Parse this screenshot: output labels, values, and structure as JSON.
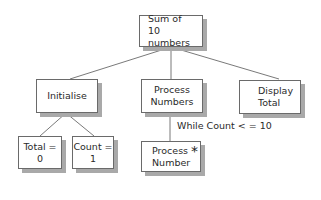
{
  "diagram": {
    "type": "structure-chart",
    "root": {
      "line1": "Sum of",
      "line2": "10 numbers"
    },
    "children": [
      {
        "id": "initialise",
        "line1": "Initialise",
        "line2": ""
      },
      {
        "id": "process-numbers",
        "line1": "Process",
        "line2": "Numbers"
      },
      {
        "id": "display-total",
        "line1": "Display",
        "line2": "Total"
      }
    ],
    "initialise_children": [
      {
        "id": "total",
        "label": "Total = 0"
      },
      {
        "id": "count",
        "label": "Count = 1"
      }
    ],
    "process_children": [
      {
        "id": "process-number",
        "line1": "Process",
        "line2": "Number",
        "marker": "*"
      }
    ],
    "loop_condition": "While Count < = 10"
  }
}
